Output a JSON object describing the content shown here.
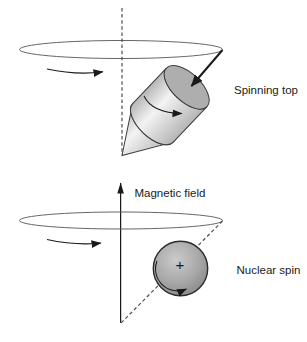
{
  "figure": {
    "top_panel": {
      "label": "Spinning top"
    },
    "bottom_panel": {
      "field_label": "Magnetic field",
      "label": "Nuclear spin",
      "charge_symbol": "+"
    },
    "colors": {
      "ink": "#1a1a1a",
      "top_face": "#aeaeae",
      "body_edge": "#b6b6b6",
      "body_highlight": "#f3f3f3",
      "sphere_light": "#cbcbcb",
      "sphere_mid": "#a8a8a8",
      "sphere_dark": "#8c8c8c"
    }
  }
}
